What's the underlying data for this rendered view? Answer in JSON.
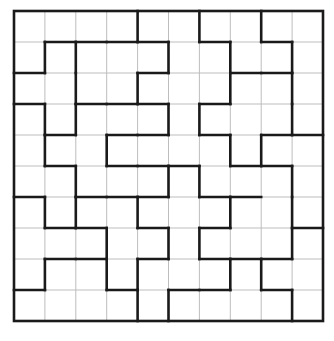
{
  "puzzle": {
    "type": "region-division-grid",
    "rows": 10,
    "cols": 10,
    "colors": {
      "background": "#ffffff",
      "thin_line": "#bdbdbd",
      "thick_line": "#1a1a1a"
    },
    "vertical_walls": [
      [
        4,
        6,
        8
      ],
      [
        1,
        2,
        5,
        7,
        9
      ],
      [
        2,
        4,
        7,
        9
      ],
      [
        1,
        2,
        5,
        6,
        9
      ],
      [
        1,
        3,
        7,
        8
      ],
      [
        2,
        5,
        6,
        9
      ],
      [
        1,
        2,
        4,
        7,
        9
      ],
      [
        3,
        5,
        6,
        9
      ],
      [
        1,
        3,
        4,
        7,
        8
      ],
      [
        4,
        5,
        9
      ]
    ],
    "horizontal_walls": [
      [
        1,
        2,
        3,
        4,
        6,
        8
      ],
      [
        0,
        4,
        7,
        8
      ],
      [
        0,
        2,
        3,
        4,
        6
      ],
      [
        1,
        3,
        4,
        6,
        8,
        9
      ],
      [
        1,
        3,
        4,
        5,
        7,
        8
      ],
      [
        0,
        2,
        3,
        4,
        6,
        7
      ],
      [
        1,
        2,
        4,
        6,
        9
      ],
      [
        1,
        2,
        4,
        6,
        7,
        8
      ],
      [
        0,
        3,
        5,
        6,
        8
      ]
    ]
  }
}
